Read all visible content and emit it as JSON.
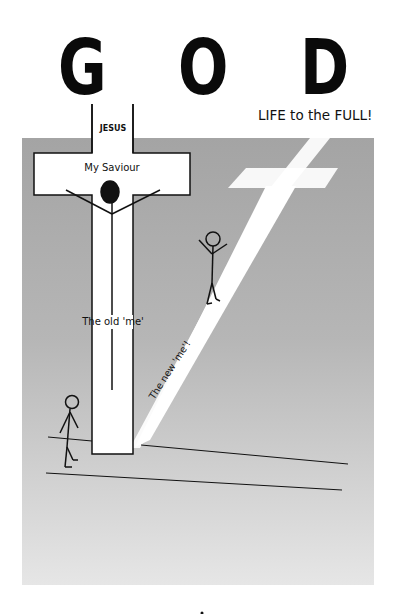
{
  "poster": {
    "title_letters": [
      "G",
      "O",
      "D"
    ],
    "tagline": "LIFE to the FULL!",
    "cross_labels": {
      "top": "JESUS",
      "crossbar": "My Saviour",
      "upright": "The old 'me'"
    },
    "path_label": "The new 'me'!",
    "colors": {
      "background_panel": "#a9a9a9",
      "panel_light": "#e2e2e2",
      "cross_fill": "#ffffff",
      "ink": "#111111"
    }
  }
}
